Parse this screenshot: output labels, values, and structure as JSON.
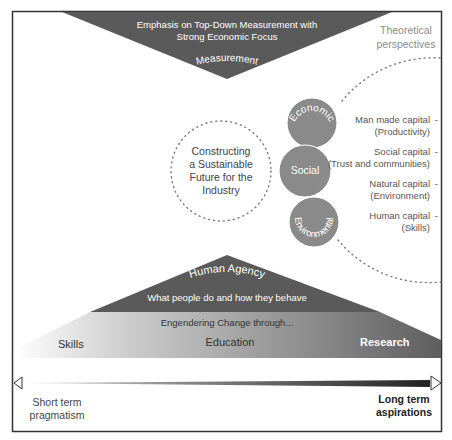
{
  "top": {
    "line1": "Emphasis on Top-Down Measurement with",
    "line2": "Strong Economic Focus",
    "label": "Measurement"
  },
  "theoretical": {
    "line1": "Theoretical",
    "line2": "perspectives"
  },
  "center": {
    "lines": [
      "Constructing",
      "a Sustainable",
      "Future for the",
      "Industry"
    ]
  },
  "pillars": {
    "economic": "Economic",
    "social": "Social",
    "environmental": "Environmental"
  },
  "capitals": [
    {
      "line1": "Man made capital",
      "line2": "(Productivity)",
      "dash": "-"
    },
    {
      "line1": "Social capital",
      "line2": "(Trust and communities)",
      "dash": "-"
    },
    {
      "line1": "Natural capital",
      "line2": "(Environment)",
      "dash": "-"
    },
    {
      "line1": "Human capital",
      "line2": "(Skills)",
      "dash": "-"
    }
  ],
  "agency": {
    "title": "Human Agency",
    "subtitle": "What people do and how they behave"
  },
  "band": {
    "caption": "Engendering Change through...",
    "skills": "Skills",
    "education": "Education",
    "research": "Research"
  },
  "axis": {
    "left_line1": "Short term",
    "left_line2": "pragmatism",
    "right_line1": "Long term",
    "right_line2": "aspirations"
  },
  "colors": {
    "dark": "#5a5a5a",
    "circle": "#8a8a8a",
    "frame": "#333333",
    "muted_text": "#8c8c8c"
  }
}
